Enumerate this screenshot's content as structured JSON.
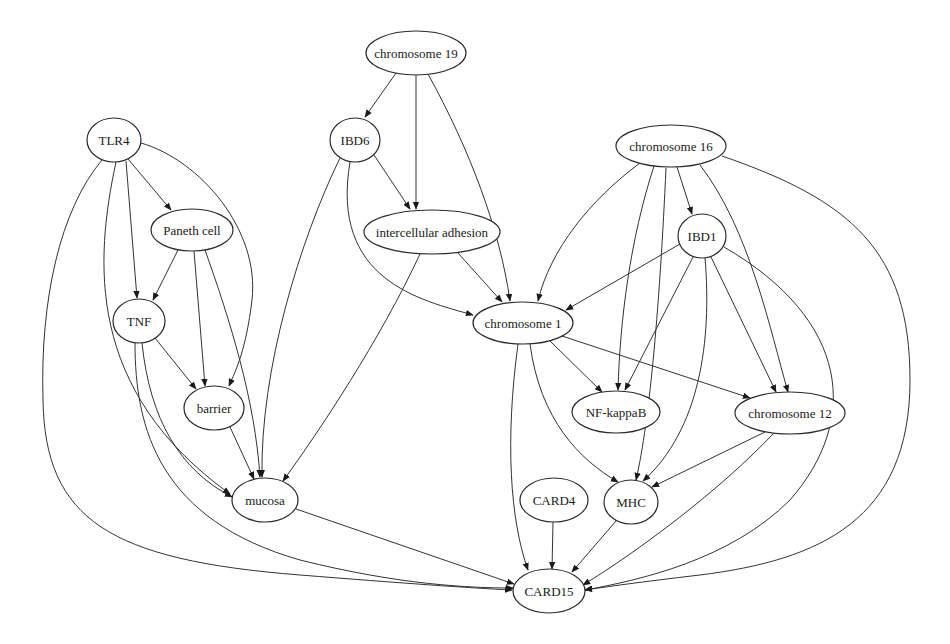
{
  "diagram": {
    "type": "directed-graph",
    "nodes": [
      {
        "id": "chr19",
        "label": "chromosome 19",
        "cx": 416,
        "cy": 53,
        "rx": 50,
        "ry": 22
      },
      {
        "id": "tlr4",
        "label": "TLR4",
        "cx": 114,
        "cy": 140,
        "rx": 27,
        "ry": 22
      },
      {
        "id": "ibd6",
        "label": "IBD6",
        "cx": 355,
        "cy": 140,
        "rx": 25,
        "ry": 22
      },
      {
        "id": "chr16",
        "label": "chromosome 16",
        "cx": 671,
        "cy": 146,
        "rx": 55,
        "ry": 21
      },
      {
        "id": "paneth",
        "label": "Paneth cell",
        "cx": 192,
        "cy": 230,
        "rx": 41,
        "ry": 21
      },
      {
        "id": "adhesion",
        "label": "intercellular adhesion",
        "cx": 432,
        "cy": 232,
        "rx": 68,
        "ry": 22
      },
      {
        "id": "ibd1",
        "label": "IBD1",
        "cx": 702,
        "cy": 236,
        "rx": 24,
        "ry": 22
      },
      {
        "id": "tnf",
        "label": "TNF",
        "cx": 139,
        "cy": 321,
        "rx": 26,
        "ry": 22
      },
      {
        "id": "chr1",
        "label": "chromosome 1",
        "cx": 523,
        "cy": 323,
        "rx": 50,
        "ry": 21
      },
      {
        "id": "barrier",
        "label": "barrier",
        "cx": 214,
        "cy": 408,
        "rx": 30,
        "ry": 22
      },
      {
        "id": "nfkb",
        "label": "NF-kappaB",
        "cx": 616,
        "cy": 412,
        "rx": 44,
        "ry": 21
      },
      {
        "id": "chr12",
        "label": "chromosome 12",
        "cx": 790,
        "cy": 413,
        "rx": 55,
        "ry": 21
      },
      {
        "id": "mucosa",
        "label": "mucosa",
        "cx": 265,
        "cy": 500,
        "rx": 33,
        "ry": 22
      },
      {
        "id": "card4",
        "label": "CARD4",
        "cx": 554,
        "cy": 500,
        "rx": 34,
        "ry": 22
      },
      {
        "id": "mhc",
        "label": "MHC",
        "cx": 631,
        "cy": 502,
        "rx": 27,
        "ry": 22
      },
      {
        "id": "card15",
        "label": "CARD15",
        "cx": 549,
        "cy": 591,
        "rx": 36,
        "ry": 22
      }
    ],
    "edges": [
      {
        "from": "chr19",
        "to": "ibd6",
        "d": "M 396 73 L 365 117"
      },
      {
        "from": "chr19",
        "to": "adhesion",
        "d": "M 416 75 L 416 209"
      },
      {
        "from": "chr19",
        "to": "chr1",
        "d": "M 428 74 C 470 150 500 230 510 301"
      },
      {
        "from": "tlr4",
        "to": "paneth",
        "d": "M 128 159 L 171 210"
      },
      {
        "from": "tlr4",
        "to": "tnf",
        "d": "M 126 161 L 137 298"
      },
      {
        "from": "tlr4",
        "to": "barrier",
        "d": "M 141 143 C 200 160 260 230 252 300 C 246 350 236 370 229 386"
      },
      {
        "from": "tlr4",
        "to": "mucosa",
        "d": "M 116 162 C 95 260 85 390 230 494"
      },
      {
        "from": "tlr4",
        "to": "card15",
        "d": "M 102 160 C 60 210 40 300 43 400 C 45 520 110 560 300 575 C 400 583 470 588 512 590"
      },
      {
        "from": "ibd6",
        "to": "adhesion",
        "d": "M 374 155 L 410 209"
      },
      {
        "from": "ibd6",
        "to": "mucosa",
        "d": "M 340 158 C 300 240 260 370 262 477"
      },
      {
        "from": "ibd6",
        "to": "chr1",
        "d": "M 350 162 C 330 280 420 300 473 315"
      },
      {
        "from": "paneth",
        "to": "tnf",
        "d": "M 178 250 L 153 300"
      },
      {
        "from": "paneth",
        "to": "barrier",
        "d": "M 194 251 L 205 386"
      },
      {
        "from": "paneth",
        "to": "mucosa",
        "d": "M 205 250 C 230 320 255 400 260 477"
      },
      {
        "from": "adhesion",
        "to": "chr1",
        "d": "M 458 253 L 502 302"
      },
      {
        "from": "adhesion",
        "to": "mucosa",
        "d": "M 420 254 C 380 340 320 430 283 481"
      },
      {
        "from": "chr16",
        "to": "ibd1",
        "d": "M 677 167 L 692 214"
      },
      {
        "from": "chr16",
        "to": "chr1",
        "d": "M 640 163 C 590 200 550 250 538 301"
      },
      {
        "from": "chr16",
        "to": "nfkb",
        "d": "M 654 166 C 630 240 620 320 618 390"
      },
      {
        "from": "chr16",
        "to": "mhc",
        "d": "M 666 168 C 660 300 650 420 636 480"
      },
      {
        "from": "chr16",
        "to": "chr12",
        "d": "M 700 165 C 750 230 770 330 788 392"
      },
      {
        "from": "chr16",
        "to": "card15",
        "d": "M 722 156 C 850 200 910 250 910 380 C 910 520 820 560 700 575 C 640 582 605 587 585 590"
      },
      {
        "from": "ibd1",
        "to": "chr1",
        "d": "M 680 244 L 566 310"
      },
      {
        "from": "ibd1",
        "to": "nfkb",
        "d": "M 693 257 L 625 390"
      },
      {
        "from": "ibd1",
        "to": "mhc",
        "d": "M 705 258 C 712 340 700 430 643 481"
      },
      {
        "from": "ibd1",
        "to": "chr12",
        "d": "M 711 257 L 776 392"
      },
      {
        "from": "ibd1",
        "to": "card15",
        "d": "M 724 247 C 850 320 860 420 790 500 C 730 560 640 580 585 590"
      },
      {
        "from": "tnf",
        "to": "barrier",
        "d": "M 155 338 L 196 389"
      },
      {
        "from": "tnf",
        "to": "mucosa",
        "d": "M 142 343 C 150 420 180 470 232 497"
      },
      {
        "from": "tnf",
        "to": "card15",
        "d": "M 135 343 C 135 430 160 520 300 560 C 400 585 470 588 513 588"
      },
      {
        "from": "chr1",
        "to": "nfkb",
        "d": "M 550 341 L 602 392"
      },
      {
        "from": "chr1",
        "to": "chr12",
        "d": "M 562 336 L 750 398"
      },
      {
        "from": "chr1",
        "to": "mhc",
        "d": "M 530 344 C 540 420 580 460 618 482"
      },
      {
        "from": "chr1",
        "to": "card15",
        "d": "M 518 344 C 505 440 510 520 528 570"
      },
      {
        "from": "barrier",
        "to": "mucosa",
        "d": "M 230 427 L 254 479"
      },
      {
        "from": "chr12",
        "to": "mhc",
        "d": "M 765 432 L 652 487"
      },
      {
        "from": "chr12",
        "to": "card15",
        "d": "M 773 434 C 720 490 640 550 583 585"
      },
      {
        "from": "mucosa",
        "to": "card15",
        "d": "M 296 509 L 514 584"
      },
      {
        "from": "card4",
        "to": "card15",
        "d": "M 553 522 L 552 569"
      },
      {
        "from": "mhc",
        "to": "card15",
        "d": "M 616 521 L 572 572"
      }
    ]
  }
}
